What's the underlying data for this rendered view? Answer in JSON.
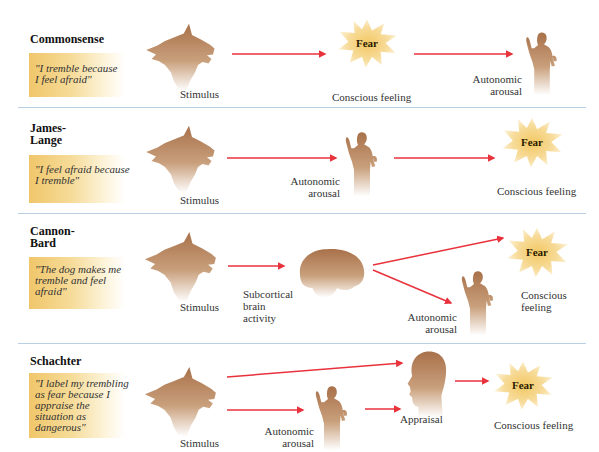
{
  "colors": {
    "arrow": "#e8323c",
    "silhouette_top": "#b07a4e",
    "silhouette_bottom": "#ffffff",
    "fear_burst": "#f5d487",
    "quote_box": "#f0c66a",
    "divider": "#b9cfe3"
  },
  "panels": [
    {
      "theory": "Commonsense",
      "quote": "\"I tremble because\nI feel afraid\"",
      "labels": {
        "stimulus": "Stimulus",
        "fear": "Fear",
        "conscious_feeling": "Conscious feeling",
        "autonomic_arousal": "Autonomic\narousal"
      }
    },
    {
      "theory": "James-\nLange",
      "quote": "\"I feel afraid because\nI tremble\"",
      "labels": {
        "stimulus": "Stimulus",
        "autonomic_arousal": "Autonomic\narousal",
        "fear": "Fear",
        "conscious_feeling": "Conscious feeling"
      }
    },
    {
      "theory": "Cannon-\nBard",
      "quote": "\"The dog makes me\ntremble and feel\nafraid\"",
      "labels": {
        "stimulus": "Stimulus",
        "subcortical": "Subcortical\nbrain\nactivity",
        "fear": "Fear",
        "conscious_feeling": "Conscious\nfeeling",
        "autonomic_arousal": "Autonomic\narousal"
      }
    },
    {
      "theory": "Schachter",
      "quote": "\"I label my trembling\nas fear because I\nappraise the\nsituation as\ndangerous\"",
      "labels": {
        "stimulus": "Stimulus",
        "autonomic_arousal": "Autonomic\narousal",
        "appraisal": "Appraisal",
        "fear": "Fear",
        "conscious_feeling": "Conscious feeling"
      }
    }
  ],
  "icons": {
    "stimulus": "wolf-head-icon",
    "arousal": "trembling-person-icon",
    "brain": "brain-icon",
    "appraisal": "head-profile-icon",
    "fear": "starburst-icon"
  }
}
